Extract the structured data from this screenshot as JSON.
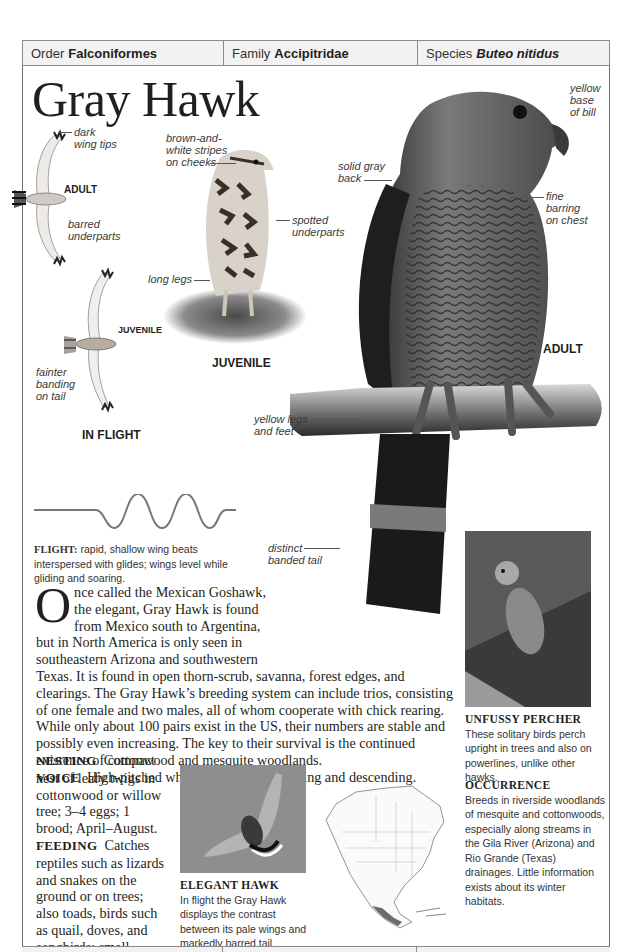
{
  "taxonomy": {
    "order_label": "Order",
    "order_value": "Falconiformes",
    "family_label": "Family",
    "family_value": "Accipitridae",
    "species_label": "Species",
    "species_value": "Buteo nitidus"
  },
  "title": "Gray Hawk",
  "illustrations": {
    "flight_adult_label": "ADULT",
    "flight_juvenile_label": "JUVENILE",
    "in_flight_label": "IN FLIGHT",
    "perched_juvenile_label": "JUVENILE",
    "perched_adult_label": "ADULT"
  },
  "annotations": {
    "dark_wing_tips": [
      "dark",
      "wing tips"
    ],
    "barred_underparts": [
      "barred",
      "underparts"
    ],
    "fainter_banding": [
      "fainter",
      "banding",
      "on tail"
    ],
    "brown_white_stripes": [
      "brown-and-",
      "white stripes",
      "on cheeks"
    ],
    "spotted_underparts": [
      "spotted",
      "underparts"
    ],
    "long_legs": [
      "long legs"
    ],
    "solid_gray_back": [
      "solid gray",
      "back"
    ],
    "yellow_base_bill": [
      "yellow",
      "base",
      "of bill"
    ],
    "fine_barring": [
      "fine",
      "barring",
      "on chest"
    ],
    "yellow_legs": [
      "yellow legs",
      "and feet"
    ],
    "distinct_banded_tail": [
      "distinct",
      "banded tail"
    ]
  },
  "flight": {
    "label": "FLIGHT:",
    "text": "rapid, shallow wing beats interspersed with glides; wings level while gliding and soaring."
  },
  "description": {
    "dropcap": "O",
    "text": "nce called the Mexican Goshawk, the elegant, Gray Hawk is found from Mexico south to Argentina, but in North America is only seen in southeastern Arizona and southwestern Texas. It is found in open thorn-scrub, savanna, forest edges, and clearings. The Gray Hawk’s breeding system can include trios, consisting of one female and two males, all of whom cooperate with chick rearing. While only about 100 pairs exist in the US, their numbers are stable and possibly even increasing. The key to their survival is the continued existence of cottonwood and mesquite woodlands."
  },
  "voice": {
    "label": "VOICE",
    "text_before": "High-pitched whistled alarm,",
    "call": "creee",
    "text_after": ", rising and descending."
  },
  "nesting": {
    "label": "NESTING",
    "text": "Compact nest of leafy twigs in cottonwood or willow tree; 3–4 eggs; 1 brood; April–August."
  },
  "feeding": {
    "label": "FEEDING",
    "text": "Catches reptiles such as lizards and snakes on the ground or on trees; also toads, birds such as quail, doves, and songbirds; small mammals."
  },
  "elegant_hawk": {
    "heading": "ELEGANT HAWK",
    "text": "In flight the Gray Hawk displays the contrast between its pale wings and markedly barred tail."
  },
  "unfussy_percher": {
    "heading": "UNFUSSY PERCHER",
    "text": "These solitary birds perch upright in trees and also on powerlines, unlike other hawks."
  },
  "occurrence": {
    "heading": "OCCURRENCE",
    "text": "Breeds in riverside woodlands of mesquite and cottonwoods, especially along streams in the Gila River (Arizona) and Rio Grande (Texas) drainages. Little information exists about its winter habitats."
  },
  "colors": {
    "border": "#8a8a8a",
    "bar_bg": "#f2f2f2",
    "text": "#231f20",
    "range_map_fill": "#6a6a6a"
  }
}
